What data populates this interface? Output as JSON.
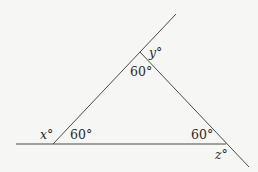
{
  "diagram": {
    "type": "triangle-exterior-angles",
    "interior_angles": {
      "top": "60°",
      "left": "60°",
      "right": "60°"
    },
    "exterior_angles": {
      "left": "x°",
      "top": "y°",
      "right": "z°"
    },
    "colors": {
      "background": "#f6f6f4",
      "lines": "#4a4a4a",
      "text": "#2a2a2a"
    }
  }
}
